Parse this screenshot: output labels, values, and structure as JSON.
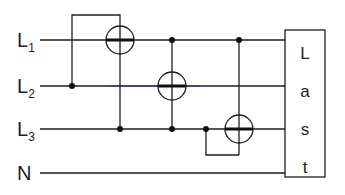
{
  "diagram": {
    "type": "three-phase wiring with three current/energy meters",
    "lines": [
      {
        "id": "L1",
        "label": "L",
        "sub": "1",
        "y": 40
      },
      {
        "id": "L2",
        "label": "L",
        "sub": "2",
        "y": 86
      },
      {
        "id": "L3",
        "label": "L",
        "sub": "3",
        "y": 129
      },
      {
        "id": "N",
        "label": "N",
        "sub": "",
        "y": 173
      }
    ],
    "load": {
      "letters": [
        "L",
        "a",
        "s",
        "t"
      ]
    },
    "meters": [
      {
        "on": "L1",
        "cx": 120,
        "cy": 40
      },
      {
        "on": "L2",
        "cx": 172,
        "cy": 86
      },
      {
        "on": "L3",
        "cx": 239,
        "cy": 129
      }
    ],
    "colors": {
      "wire": "#1e1e1e",
      "l2_tint": "#3a3aa8",
      "background": "#ffffff"
    }
  }
}
